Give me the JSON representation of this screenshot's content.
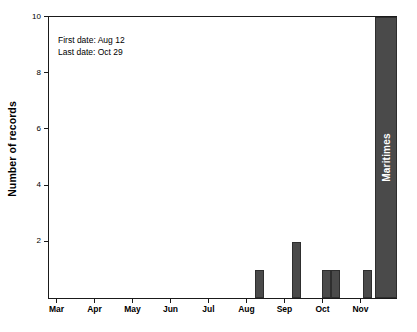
{
  "chart_data": {
    "type": "bar",
    "title": "",
    "xlabel": "",
    "ylabel": "Number of records",
    "ylim": [
      0,
      10
    ],
    "grid": false,
    "legend": null,
    "x_tick_labels": [
      "Mar",
      "Apr",
      "May",
      "Jun",
      "Jul",
      "Aug",
      "Sep",
      "Oct",
      "Nov"
    ],
    "y_tick_labels": [
      "2",
      "4",
      "6",
      "8",
      "10"
    ],
    "y_ticks": [
      2,
      4,
      6,
      8,
      10
    ],
    "bar_color": "#4a4a4a",
    "bar_edge_color": "#2e2e2e",
    "series": [
      {
        "name": "Number of records",
        "bars": [
          {
            "label": "Aug 12",
            "month": "Aug",
            "value": 1
          },
          {
            "label": "Sep 24",
            "month": "Sep",
            "value": 2
          },
          {
            "label": "Oct 8",
            "month": "Oct",
            "value": 1
          },
          {
            "label": "Oct 15",
            "month": "Oct",
            "value": 1
          },
          {
            "label": "Oct 29",
            "month": "Nov",
            "value": 1
          }
        ]
      }
    ],
    "total_bar": {
      "label": "Maritimes",
      "value": 10,
      "color": "#4a4a4a",
      "text_color": "#ffffff"
    },
    "annotations": [
      "First date: Aug 12",
      "Last date: Oct 29"
    ]
  }
}
